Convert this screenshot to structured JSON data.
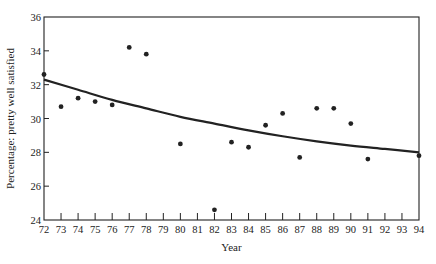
{
  "chart_data": {
    "type": "scatter",
    "title": "",
    "xlabel": "Year",
    "ylabel": "Percentage: pretty well satisfied",
    "xlim": [
      72,
      94
    ],
    "ylim": [
      24,
      36
    ],
    "xticks": [
      "72",
      "73",
      "74",
      "75",
      "76",
      "77",
      "78",
      "79",
      "80",
      "81",
      "82",
      "83",
      "84",
      "85",
      "86",
      "87",
      "88",
      "89",
      "90",
      "91",
      "92",
      "93",
      "94"
    ],
    "yticks": [
      "24",
      "26",
      "28",
      "30",
      "32",
      "34",
      "36"
    ],
    "grid": false,
    "legend": null,
    "series": [
      {
        "name": "Observed",
        "type": "scatter",
        "x": [
          72,
          73,
          74,
          75,
          76,
          77,
          78,
          80,
          82,
          83,
          84,
          85,
          86,
          87,
          88,
          89,
          90,
          91,
          94
        ],
        "y": [
          32.6,
          30.7,
          31.2,
          31.0,
          30.8,
          34.2,
          33.8,
          28.5,
          24.6,
          28.6,
          28.3,
          29.6,
          30.3,
          27.7,
          30.6,
          30.6,
          29.7,
          27.6,
          27.8
        ]
      },
      {
        "name": "Fitted trend",
        "type": "line",
        "x": [
          72,
          74,
          76,
          78,
          80,
          82,
          84,
          86,
          88,
          90,
          92,
          94
        ],
        "y": [
          32.3,
          31.7,
          31.1,
          30.6,
          30.1,
          29.7,
          29.3,
          28.95,
          28.65,
          28.4,
          28.2,
          28.0
        ]
      }
    ]
  },
  "plot": {
    "left": 44,
    "right": 419,
    "top": 17,
    "bottom": 220
  },
  "colors": {
    "ink": "#222222",
    "background": "#ffffff"
  }
}
